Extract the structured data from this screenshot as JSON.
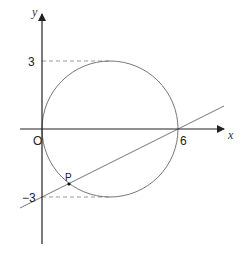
{
  "diagram": {
    "type": "coordinate-geometry",
    "axes": {
      "x_label": "x",
      "y_label": "y",
      "origin_label": "O"
    },
    "tick_labels": {
      "y_top": "3",
      "y_bottom": "−3",
      "x_right": "6"
    },
    "circle": {
      "center": [
        3,
        0
      ],
      "radius": 3
    },
    "line": {
      "through": [
        [
          0,
          -3
        ],
        [
          6,
          0
        ]
      ]
    },
    "point": {
      "label": "P"
    },
    "colors": {
      "axis": "#222222",
      "curve": "#777777",
      "dashed": "#999999"
    }
  }
}
